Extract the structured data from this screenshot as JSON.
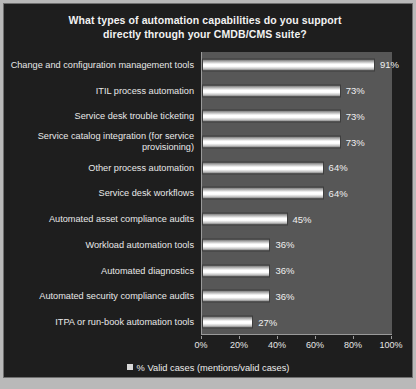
{
  "chart_data": {
    "type": "bar",
    "orientation": "horizontal",
    "title": "What types of automation capabilities do you support directly through your CMDB/CMS suite?",
    "title_line1": "What types of automation capabilities do you support",
    "title_line2": "directly through your CMDB/CMS suite?",
    "xlabel": "",
    "ylabel": "",
    "xlim": [
      0,
      100
    ],
    "grid": false,
    "legend_position": "bottom",
    "categories": [
      "Change and configuration management tools",
      "ITIL process automation",
      "Service desk trouble ticketing",
      "Service catalog integration (for service provisioning)",
      "Other process automation",
      "Service desk workflows",
      "Automated asset compliance audits",
      "Workload automation tools",
      "Automated diagnostics",
      "Automated security compliance audits",
      "ITPA or run-book automation tools"
    ],
    "values": [
      91,
      73,
      73,
      73,
      64,
      64,
      45,
      36,
      36,
      36,
      27
    ],
    "value_labels": [
      "91%",
      "73%",
      "73%",
      "73%",
      "64%",
      "64%",
      "45%",
      "36%",
      "36%",
      "36%",
      "27%"
    ],
    "xticks": [
      0,
      20,
      40,
      60,
      80,
      100
    ],
    "xtick_labels": [
      "0%",
      "20%",
      "40%",
      "60%",
      "80%",
      "100%"
    ],
    "series": [
      {
        "name": "% Valid cases (mentions/valid cases)",
        "values": [
          91,
          73,
          73,
          73,
          64,
          64,
          45,
          36,
          36,
          36,
          27
        ]
      }
    ],
    "legend": [
      "% Valid cases (mentions/valid cases)"
    ]
  },
  "colors": {
    "outer_background": "#1b1b1b",
    "plot_background": "#575757",
    "bar_fill": "#ffffff",
    "text": "#eeeeee",
    "axis": "#9a9a9a",
    "frame": "#6f6f6f"
  },
  "legend": {
    "label": "% Valid cases (mentions/valid cases)"
  }
}
